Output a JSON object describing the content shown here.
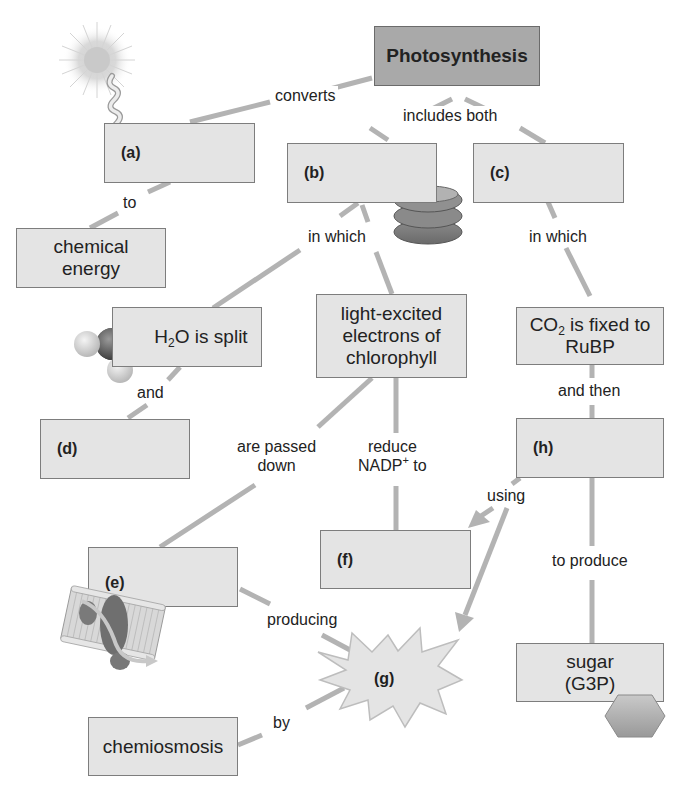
{
  "diagram": {
    "type": "concept-map",
    "title": "Photosynthesis",
    "colors": {
      "box_fill": "#e4e4e4",
      "box_border": "#7d7d7d",
      "title_fill": "#a9a9a9",
      "connector": "#b3b3b3",
      "text": "#222222"
    },
    "nodes": {
      "photosynthesis": "Photosynthesis",
      "a": "(a)",
      "b": "(b)",
      "c": "(c)",
      "d": "(d)",
      "e": "(e)",
      "f": "(f)",
      "g": "(g)",
      "h": "(h)",
      "chemical_energy": {
        "line1": "chemical",
        "line2": "energy"
      },
      "h2o_split": {
        "pre": "H",
        "sub": "2",
        "post": "O is split"
      },
      "light_excited": {
        "line1": "light-excited",
        "line2": "electrons of",
        "line3": "chlorophyll"
      },
      "co2_fixed": {
        "pre": "CO",
        "sub": "2",
        "post": " is fixed to",
        "line2": "RuBP"
      },
      "sugar": {
        "line1": "sugar",
        "line2": "(G3P)"
      },
      "chemiosmosis": "chemiosmosis"
    },
    "links": {
      "converts": "converts",
      "includes_both": "includes both",
      "to": "to",
      "in_which_left": "in which",
      "in_which_right": "in which",
      "and": "and",
      "are_passed_down": {
        "line1": "are passed",
        "line2": "down"
      },
      "reduce_nadp": {
        "line1": "reduce",
        "pre": "NADP",
        "sup": "+",
        "post": " to"
      },
      "and_then": "and then",
      "using": "using",
      "to_produce": "to produce",
      "producing": "producing",
      "by": "by"
    },
    "icons": [
      "sun-icon",
      "light-wave-icon",
      "thylakoid-stack-icon",
      "water-molecule-icon",
      "membrane-protein-icon",
      "starburst-icon",
      "hexagon-sugar-icon"
    ]
  }
}
